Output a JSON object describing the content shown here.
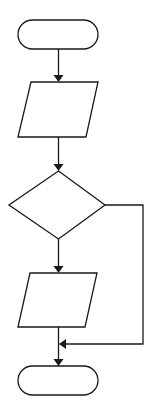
{
  "diagram": {
    "type": "flowchart",
    "orientation": "top-to-bottom",
    "colors": {
      "stroke": "#1a1a1a",
      "fill": "#ffffff",
      "background": "#ffffff"
    },
    "nodes": [
      {
        "id": "start",
        "shape": "terminator",
        "label": ""
      },
      {
        "id": "input1",
        "shape": "parallelogram",
        "label": ""
      },
      {
        "id": "decision",
        "shape": "diamond",
        "label": ""
      },
      {
        "id": "input2",
        "shape": "parallelogram",
        "label": ""
      },
      {
        "id": "end",
        "shape": "terminator",
        "label": ""
      }
    ],
    "edges": [
      {
        "from": "start",
        "to": "input1",
        "label": ""
      },
      {
        "from": "input1",
        "to": "decision",
        "label": ""
      },
      {
        "from": "decision",
        "to": "input2",
        "label": ""
      },
      {
        "from": "input2",
        "to": "end",
        "label": ""
      },
      {
        "from": "decision",
        "to": "end",
        "route": "right-side bypass",
        "label": ""
      }
    ]
  }
}
